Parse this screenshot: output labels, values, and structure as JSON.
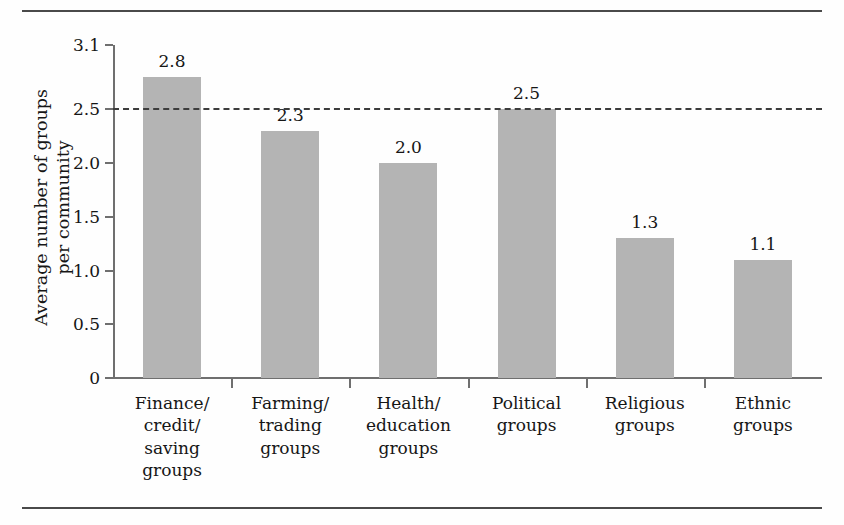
{
  "figure": {
    "clipped_caption": "",
    "background_color": "#fefefe",
    "rule_color": "#4a4a4a",
    "bar_color": "#b4b4b4",
    "axis_color": "#6f6f6f",
    "refline_color": "#3c3c3c"
  },
  "chart_data": {
    "type": "bar",
    "title": "",
    "xlabel": "",
    "ylabel": "Average number of groups\nper community",
    "ylabel_line1": "Average number of groups",
    "ylabel_line2": "per community",
    "categories": [
      "Finance/\ncredit/\nsaving\ngroups",
      "Farming/\ntrading\ngroups",
      "Health/\neducation\ngroups",
      "Political\ngroups",
      "Religious\ngroups",
      "Ethnic\ngroups"
    ],
    "category_lines": [
      [
        "Finance/",
        "credit/",
        "saving",
        "groups"
      ],
      [
        "Farming/",
        "trading",
        "groups"
      ],
      [
        "Health/",
        "education",
        "groups"
      ],
      [
        "Political",
        "groups"
      ],
      [
        "Religious",
        "groups"
      ],
      [
        "Ethnic",
        "groups"
      ]
    ],
    "values": [
      2.8,
      2.3,
      2.0,
      2.5,
      1.3,
      1.1
    ],
    "value_labels": [
      "2.8",
      "2.3",
      "2.0",
      "2.5",
      "1.3",
      "1.1"
    ],
    "ylim": [
      0,
      3.1
    ],
    "yticks": [
      0,
      0.5,
      1.0,
      1.5,
      2.0,
      2.5,
      3.1
    ],
    "ytick_labels": [
      "0",
      "0.5",
      "1.0",
      "1.5",
      "2.0",
      "2.5",
      "3.1"
    ],
    "reference_line": {
      "value": 2.5,
      "style": "dashed",
      "label": ""
    },
    "grid": false,
    "legend": null
  }
}
